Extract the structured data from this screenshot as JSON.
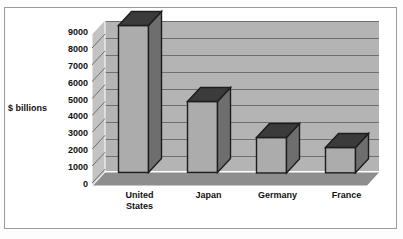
{
  "chart_data": {
    "type": "bar",
    "title": "",
    "subtitle": "",
    "xlabel": "",
    "ylabel": "$ billions",
    "categories": [
      "United States",
      "Japan",
      "Germany",
      "France"
    ],
    "category_lines": [
      [
        "United",
        "States"
      ],
      [
        "Japan"
      ],
      [
        "Germany"
      ],
      [
        "France"
      ]
    ],
    "values": [
      8700,
      4200,
      2100,
      1500
    ],
    "series": [
      {
        "name": "GDP",
        "values": [
          8700,
          4200,
          2100,
          1500
        ]
      }
    ],
    "ylim": [
      0,
      9000
    ],
    "ytick_labels": [
      "9000",
      "8000",
      "7000",
      "6000",
      "5000",
      "4000",
      "3000",
      "2000",
      "1000",
      "0"
    ],
    "ytick_values": [
      9000,
      8000,
      7000,
      6000,
      5000,
      4000,
      3000,
      2000,
      1000,
      0
    ],
    "grid": true,
    "legend": false,
    "legend_position": "none",
    "style": "3d-column",
    "colors": {
      "bar_front": "#acacac",
      "bar_side": "#6e6e6e",
      "bar_top": "#3b3b3b",
      "bar_outline": "#1d1d1d",
      "back_wall": "#b4b4b4",
      "side_wall": "#c3c3c3",
      "floor": "#8e8e8e",
      "gridline": "#6f6f6f",
      "frame": "#9a9a9a",
      "background": "#ffffff",
      "text": "#111111"
    }
  }
}
